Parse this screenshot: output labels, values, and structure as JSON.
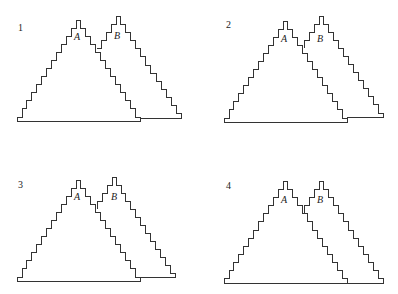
{
  "figure": {
    "panels": [
      {
        "label": "1",
        "label_pos": [
          18,
          31
        ],
        "triangles": [
          {
            "name": "A",
            "left": 17,
            "right": 140,
            "base": 121,
            "top": 20,
            "steps": 12,
            "label_pos": [
              74,
              40
            ]
          },
          {
            "name": "B",
            "left": 96,
            "right": 181,
            "base": 118,
            "top": 16,
            "steps": 12,
            "label_pos": [
              114,
              39
            ],
            "clip_left_at": 96
          }
        ]
      },
      {
        "label": "2",
        "label_pos": [
          226,
          28
        ],
        "triangles": [
          {
            "name": "A",
            "left": 224,
            "right": 347,
            "base": 122,
            "top": 21,
            "steps": 12,
            "label_pos": [
              281,
              42
            ]
          },
          {
            "name": "B",
            "left": 303,
            "right": 383,
            "base": 117,
            "top": 16,
            "steps": 12,
            "label_pos": [
              317,
              42
            ],
            "clip_left_at": 303
          }
        ]
      },
      {
        "label": "3",
        "label_pos": [
          18,
          188
        ],
        "triangles": [
          {
            "name": "A",
            "left": 17,
            "right": 140,
            "base": 281,
            "top": 180,
            "steps": 12,
            "label_pos": [
              74,
              200
            ]
          },
          {
            "name": "B",
            "left": 96,
            "right": 175,
            "base": 277,
            "top": 177,
            "steps": 12,
            "label_pos": [
              111,
              200
            ],
            "clip_left_at": 96
          }
        ]
      },
      {
        "label": "4",
        "label_pos": [
          226,
          189
        ],
        "triangles": [
          {
            "name": "A",
            "left": 224,
            "right": 347,
            "base": 283,
            "top": 181,
            "steps": 12,
            "label_pos": [
              281,
              203
            ]
          },
          {
            "name": "B",
            "left": 303,
            "right": 383,
            "base": 283,
            "top": 181,
            "steps": 12,
            "label_pos": [
              317,
              203
            ],
            "clip_left_at": 303
          }
        ]
      }
    ],
    "colors": {
      "stroke": "#333333",
      "text": "#222222",
      "background": "#ffffff"
    }
  }
}
